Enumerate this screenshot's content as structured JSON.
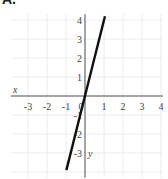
{
  "header": {
    "label": "A."
  },
  "chart_data": {
    "type": "line",
    "title": "",
    "xlabel": "x",
    "ylabel": "y",
    "xlim": [
      -3.9,
      4.1
    ],
    "ylim": [
      -4.3,
      4.3
    ],
    "grid": true,
    "x_ticks": [
      "-3",
      "-2",
      "-1",
      "0",
      "1",
      "2",
      "3",
      "4"
    ],
    "y_ticks": [
      "4",
      "3",
      "2",
      "1",
      "-1",
      "-2",
      "-3"
    ],
    "series": [
      {
        "name": "y = 4x",
        "equation": "y = 4x",
        "slope": 4,
        "intercept": 0,
        "x": [
          -0.98,
          1.05
        ],
        "y": [
          -3.9,
          4.2
        ],
        "color": "#111111"
      }
    ]
  },
  "layout": {
    "origin_px": [
      85,
      96
    ],
    "unit_px": 19
  }
}
